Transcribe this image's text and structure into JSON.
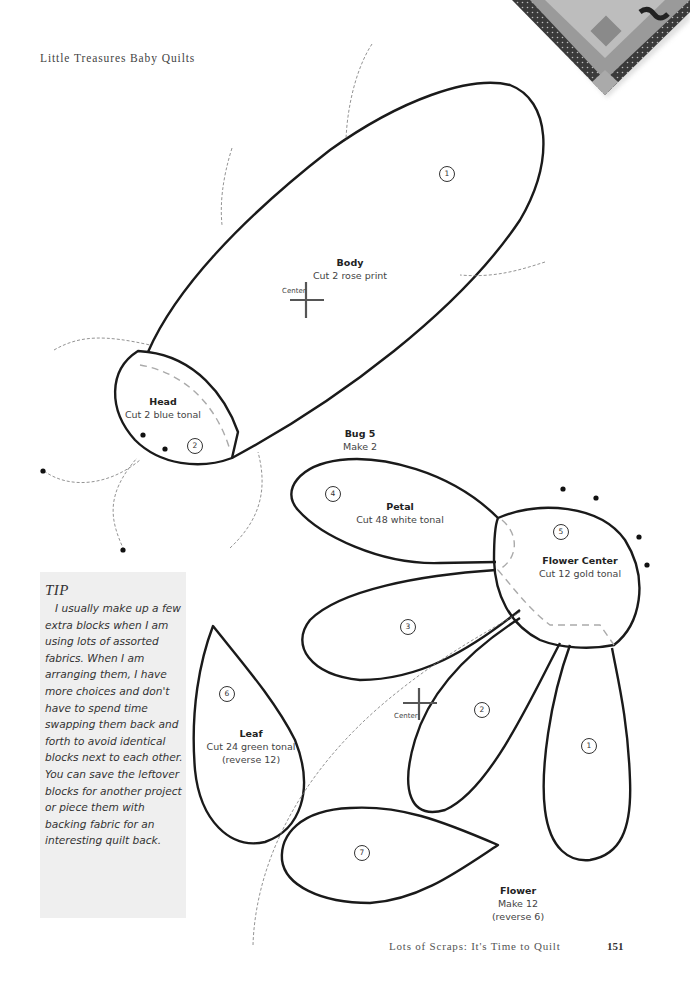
{
  "header": {
    "running_title": "Little Treasures Baby Quilts"
  },
  "footer": {
    "book_title": "Lots of Scraps: It's Time to Quilt",
    "page_number": "151"
  },
  "bug": {
    "title": "Bug 5",
    "make": "Make 2",
    "pieces": [
      {
        "number": "1",
        "name": "Body",
        "cut": "Cut 2 rose print",
        "center_label": "Center"
      },
      {
        "number": "2",
        "name": "Head",
        "cut": "Cut 2 blue tonal"
      }
    ]
  },
  "flower": {
    "title": "Flower",
    "make": "Make 12",
    "reverse": "(reverse 6)",
    "pieces": [
      {
        "number": "1"
      },
      {
        "number": "2"
      },
      {
        "number": "3"
      },
      {
        "number": "4",
        "name": "Petal",
        "cut": "Cut 48 white tonal"
      },
      {
        "number": "5",
        "name": "Flower Center",
        "cut": "Cut 12 gold tonal"
      },
      {
        "number": "6",
        "name": "Leaf",
        "cut": "Cut 24 green tonal",
        "note": "(reverse 12)"
      },
      {
        "number": "7"
      }
    ],
    "center_label": "Center"
  },
  "tip": {
    "title": "TIP",
    "body": "I usually make up a few extra blocks when I am using lots of assorted fabrics. When I am arranging them, I have more choices and don't have to spend time swapping them back and forth to avoid identical blocks next to each other. You can save the leftover blocks for another project or piece them with backing fabric for an interesting quilt back."
  },
  "colors": {
    "outline": "#1a1a1a",
    "dashed": "#999999",
    "tip_bg": "#efefef",
    "text": "#333333"
  }
}
